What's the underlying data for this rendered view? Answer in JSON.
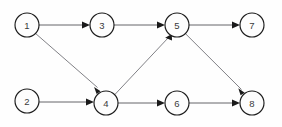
{
  "diagram": {
    "type": "directed-graph",
    "canvas": {
      "width": 282,
      "height": 127,
      "background": "#fefefe"
    },
    "style": {
      "node_radius": 12,
      "node_fill": "#fdfdfd",
      "node_stroke": "#1c1c1c",
      "label_color": "#3a3a3a",
      "edge_color": "#55555a",
      "edge_color_diagonal": "#6a6a70",
      "arrow_color": "#1a1a1a"
    },
    "nodes": [
      {
        "id": "1",
        "label": "1",
        "cx": 27,
        "cy": 25,
        "r": 12
      },
      {
        "id": "2",
        "label": "2",
        "cx": 27,
        "cy": 101,
        "r": 12
      },
      {
        "id": "3",
        "label": "3",
        "cx": 102,
        "cy": 25,
        "r": 12
      },
      {
        "id": "4",
        "label": "4",
        "cx": 106,
        "cy": 103,
        "r": 12
      },
      {
        "id": "5",
        "label": "5",
        "cx": 177,
        "cy": 25,
        "r": 12
      },
      {
        "id": "6",
        "label": "6",
        "cx": 177,
        "cy": 103,
        "r": 12
      },
      {
        "id": "7",
        "label": "7",
        "cx": 252,
        "cy": 25,
        "r": 12
      },
      {
        "id": "8",
        "label": "8",
        "cx": 252,
        "cy": 103,
        "r": 12
      }
    ],
    "edges": [
      {
        "from": "1",
        "to": "3",
        "orientation": "horizontal",
        "directed": true
      },
      {
        "from": "3",
        "to": "5",
        "orientation": "horizontal",
        "directed": true
      },
      {
        "from": "5",
        "to": "7",
        "orientation": "horizontal",
        "directed": true
      },
      {
        "from": "1",
        "to": "4",
        "orientation": "diagonal-down-right",
        "directed": true
      },
      {
        "from": "4",
        "to": "5",
        "orientation": "diagonal-up-right",
        "directed": true
      },
      {
        "from": "5",
        "to": "8",
        "orientation": "diagonal-down-right",
        "directed": true
      },
      {
        "from": "2",
        "to": "4",
        "orientation": "horizontal",
        "directed": true
      },
      {
        "from": "4",
        "to": "6",
        "orientation": "horizontal",
        "directed": true
      },
      {
        "from": "6",
        "to": "8",
        "orientation": "horizontal",
        "directed": true
      }
    ]
  }
}
